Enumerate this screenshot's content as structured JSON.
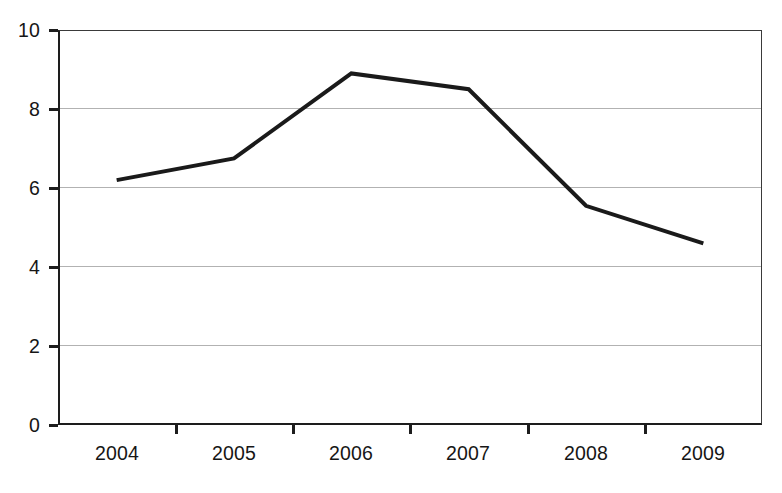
{
  "chart_data": {
    "type": "line",
    "title": "",
    "subtitle": "",
    "xlabel": "",
    "ylabel": "",
    "categories": [
      "2004",
      "2005",
      "2006",
      "2007",
      "2008",
      "2009"
    ],
    "values": [
      6.2,
      6.75,
      8.9,
      8.5,
      5.55,
      4.6
    ],
    "series": [
      {
        "name": "",
        "values": [
          6.2,
          6.75,
          8.9,
          8.5,
          5.55,
          4.6
        ],
        "color": "#1a1a1a",
        "line_width": 4
      }
    ],
    "ylim": [
      0,
      10
    ],
    "ytick_labels": [
      "0",
      "2",
      "4",
      "6",
      "8",
      "10"
    ],
    "ytick_values": [
      0,
      2,
      4,
      6,
      8,
      10
    ],
    "xtick_labels": [
      "2004",
      "2005",
      "2006",
      "2007",
      "2008",
      "2009"
    ],
    "grid": true,
    "grid_axis": "y",
    "grid_color": "#b2b2b2",
    "legend": false,
    "legend_position": "none",
    "markers": false,
    "background_color": "#ffffff",
    "axis_color": "#1d1d1d"
  }
}
